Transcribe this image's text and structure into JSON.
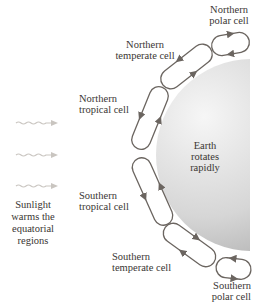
{
  "diagram": {
    "type": "atmospheric circulation cells",
    "earth": {
      "lines": [
        "Earth",
        "rotates",
        "rapidly"
      ]
    },
    "sunlight": {
      "arrow_count": 3,
      "lines": [
        "Sunlight",
        "warms the",
        "equatorial",
        "regions"
      ]
    },
    "cells": [
      {
        "id": "northern-polar",
        "lines": [
          "Northern",
          "polar cell"
        ]
      },
      {
        "id": "northern-temperate",
        "lines": [
          "Northern",
          "temperate cell"
        ]
      },
      {
        "id": "northern-tropical",
        "lines": [
          "Northern",
          "tropical cell"
        ]
      },
      {
        "id": "southern-tropical",
        "lines": [
          "Southern",
          "tropical cell"
        ]
      },
      {
        "id": "southern-temperate",
        "lines": [
          "Southern",
          "temperate cell"
        ]
      },
      {
        "id": "southern-polar",
        "lines": [
          "Southern",
          "polar cell"
        ]
      }
    ],
    "colors": {
      "loop_stroke": "#6b6560",
      "earth_light": "#f4f4f4",
      "earth_dark": "#a9a9a9",
      "sunlight_arrow": "#c9c5c0",
      "text": "#3a3633"
    }
  }
}
